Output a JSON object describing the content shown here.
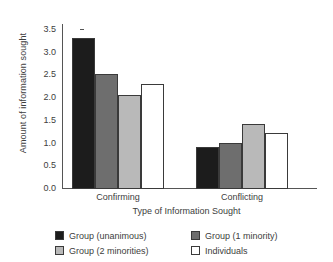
{
  "chart_data": {
    "type": "bar",
    "title": "",
    "subtitle": "",
    "xlabel": "Type of Information Sought",
    "ylabel": "Amount of information sought",
    "categories": [
      "Confirming",
      "Conflicting"
    ],
    "series": [
      {
        "name": "Group (unanimous)",
        "color": "#1c1c1c",
        "values": [
          3.33,
          0.92
        ]
      },
      {
        "name": "Group (1 minority)",
        "color": "#6e6e6e",
        "values": [
          2.53,
          1.01
        ]
      },
      {
        "name": "Group (2 minorities)",
        "color": "#b9b9b9",
        "values": [
          2.08,
          1.43
        ]
      },
      {
        "name": "Individuals",
        "color": "#ffffff",
        "values": [
          2.32,
          1.23
        ]
      }
    ],
    "ylim": [
      0.0,
      3.5
    ],
    "yticks": [
      "0.0",
      "0.5",
      "1.0",
      "1.5",
      "2.0",
      "2.5",
      "3.0",
      "3.5"
    ],
    "ytick_values": [
      0.0,
      0.5,
      1.0,
      1.5,
      2.0,
      2.5,
      3.0,
      3.5
    ],
    "grid": false,
    "legend_position": "bottom",
    "legend_columns": 2
  },
  "axes": {
    "y_title": "Amount of information sought",
    "x_title": "Type of Information Sought"
  },
  "colors": {
    "axis": "#555555",
    "text": "#3d3d3d",
    "bar_edge": "#3a3a3a",
    "background": "#ffffff"
  }
}
